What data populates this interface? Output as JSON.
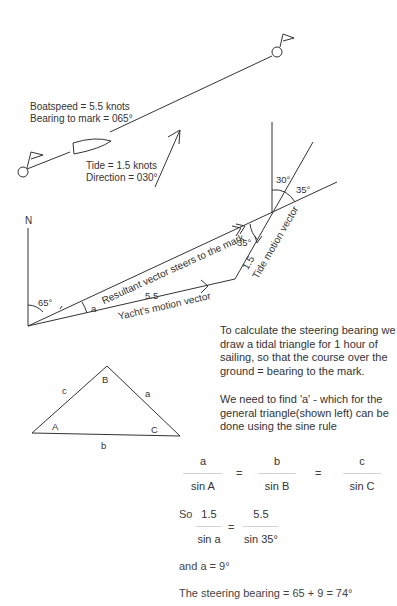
{
  "top_section": {
    "boatspeed": "Boatspeed = 5.5 knots",
    "bearing": "Bearing to mark = 065°",
    "tide": "Tide = 1.5 knots",
    "direction": "Direction = 030°"
  },
  "vector_diagram": {
    "north_label": "N",
    "angle_65": "65°",
    "angle_a": "a",
    "length_55": "5.5",
    "length_15": "1.5",
    "angle_35_inner": "35°",
    "angle_30": "30°",
    "angle_35_outer": "35°",
    "resultant_label": "Resultant vector steers to the mark",
    "yacht_label": "Yacht's motion vector",
    "tide_label": "Tide motion vector"
  },
  "triangle": {
    "vertex_A": "A",
    "vertex_B": "B",
    "vertex_C": "C",
    "side_a": "a",
    "side_b": "b",
    "side_c": "c"
  },
  "explanation": {
    "para1": "To calculate the steering bearing we draw a tidal triangle for 1 hour of sailing, so that the course over the ground = bearing to the mark.",
    "para2": "We need to find 'a' - which for the general triangle(shown left) can be done using the sine rule"
  },
  "sine_rule": {
    "f1_num": "a",
    "f1_den": "sin A",
    "f2_num": "b",
    "f2_den": "sin B",
    "f3_num": "c",
    "f3_den": "sin C",
    "equals": "="
  },
  "solution": {
    "so": "So",
    "s1_num": "1.5",
    "s1_den": "sin a",
    "s2_num": "5.5",
    "s2_den": "sin 35°",
    "equals": "=",
    "result_a": "and a = 9°",
    "steering": "The steering bearing = 65 + 9 = 74°"
  }
}
